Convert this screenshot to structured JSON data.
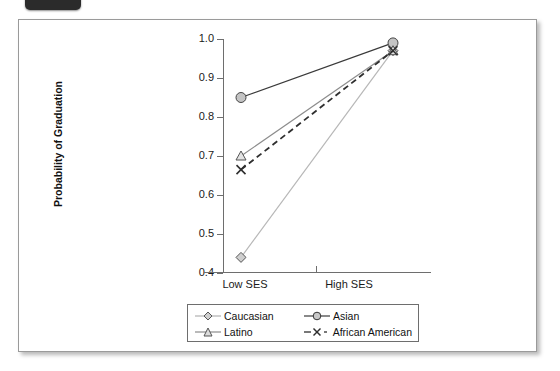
{
  "window": {
    "tab_badge": ""
  },
  "chart_data": {
    "type": "line",
    "title": "",
    "xlabel": "",
    "ylabel": "Probability of Graduation",
    "categories": [
      "Low SES",
      "High SES"
    ],
    "ylim": [
      0.4,
      1.0
    ],
    "ytick_labels": [
      "1.0",
      "0.9",
      "0.8",
      "0.7",
      "0.6",
      "0.5",
      "0.4"
    ],
    "ytick_values": [
      1.0,
      0.9,
      0.8,
      0.7,
      0.6,
      0.5,
      0.4
    ],
    "grid": false,
    "legend_position": "bottom",
    "series": [
      {
        "name": "Caucasian",
        "marker": "diamond",
        "line_style": "solid",
        "color": "#b7b7b7",
        "values": [
          0.44,
          0.97
        ]
      },
      {
        "name": "Asian",
        "marker": "circle",
        "line_style": "solid",
        "color": "#3a3a3a",
        "values": [
          0.85,
          0.99
        ]
      },
      {
        "name": "Latino",
        "marker": "triangle",
        "line_style": "solid",
        "color": "#8c8c8c",
        "values": [
          0.7,
          0.97
        ]
      },
      {
        "name": "African American",
        "marker": "x",
        "line_style": "dashed",
        "color": "#2f2f2f",
        "values": [
          0.665,
          0.97
        ]
      }
    ]
  },
  "legend": {
    "entries": [
      {
        "label": "Caucasian",
        "key": "diamond-key"
      },
      {
        "label": "Asian",
        "key": "circle-key"
      },
      {
        "label": "Latino",
        "key": "triangle-key"
      },
      {
        "label": "African American",
        "key": "x-key"
      }
    ]
  }
}
